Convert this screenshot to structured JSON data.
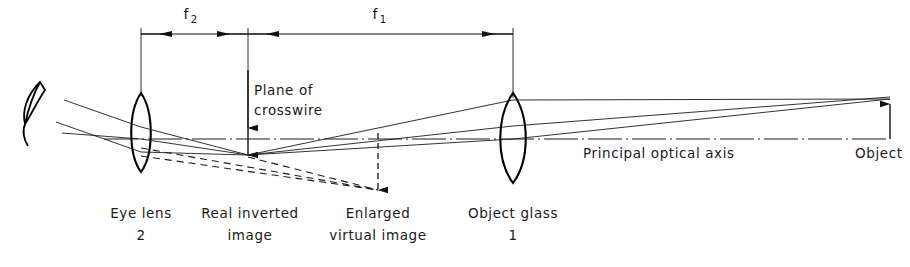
{
  "diagram": {
    "title_text": "",
    "type": "optical-ray-diagram",
    "dimensions": {
      "f2": {
        "label": "f",
        "subscript": "2"
      },
      "f1": {
        "label": "f",
        "subscript": "1"
      }
    },
    "labels": {
      "plane_of_crosswire_line1": "Plane of",
      "plane_of_crosswire_line2": "crosswire",
      "eye_lens_line1": "Eye lens",
      "eye_lens_line2": "2",
      "real_inverted_image_line1": "Real inverted",
      "real_inverted_image_line2": "image",
      "enlarged_virtual_image_line1": "Enlarged",
      "enlarged_virtual_image_line2": "virtual  image",
      "object_glass_line1": "Object  glass",
      "object_glass_line2": "1",
      "principal_optical_axis": "Principal  optical  axis",
      "object": "Object"
    },
    "colors": {
      "ink": "#111111",
      "ray": "#1c1c1c",
      "background": "#ffffff"
    }
  }
}
